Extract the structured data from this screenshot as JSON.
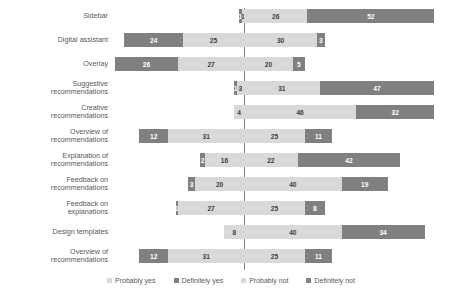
{
  "chart_data": {
    "type": "bar",
    "subtype": "diverging-stacked-bar",
    "title": "",
    "xlabel": "",
    "ylabel": "",
    "grid": false,
    "legend_position": "bottom",
    "orientation": "horizontal",
    "axis_zero_label": "0",
    "series_order_left_to_right": [
      "Definitely not",
      "Probably not",
      "Probably yes",
      "Definitely yes"
    ],
    "legend": [
      {
        "label": "Probably yes",
        "color": "#d9d9d9"
      },
      {
        "label": "Definitely yes",
        "color": "#808080"
      },
      {
        "label": "Probably not",
        "color": "#d9d9d9"
      },
      {
        "label": "Definitely not",
        "color": "#808080"
      }
    ],
    "categories": [
      "Sidebar",
      "Digital assistant",
      "Overlay",
      "Suggestive recommendations",
      "Creative recommendations",
      "Overview of recommendations",
      "Explanation of recommendations",
      "Feedback on recommendations",
      "Feedback on explanations",
      "Design templates",
      "Overview of recommendations"
    ],
    "series": [
      {
        "name": "Definitely not",
        "values": [
          1,
          24,
          26,
          1,
          0,
          12,
          2,
          3,
          1,
          0,
          12
        ]
      },
      {
        "name": "Probably not",
        "values": [
          1,
          25,
          27,
          3,
          4,
          31,
          16,
          20,
          27,
          8,
          31
        ]
      },
      {
        "name": "Probably yes",
        "values": [
          26,
          30,
          20,
          31,
          46,
          25,
          22,
          40,
          25,
          40,
          25
        ]
      },
      {
        "name": "Definitely yes",
        "values": [
          52,
          3,
          5,
          47,
          32,
          11,
          42,
          19,
          8,
          34,
          11
        ]
      }
    ]
  },
  "rows": [
    {
      "label_lines": [
        "Sidebar"
      ],
      "segments": [
        {
          "key": "dn",
          "value": "1"
        },
        {
          "key": "pn",
          "value": "1"
        },
        {
          "key": "py",
          "value": "26"
        },
        {
          "key": "dy",
          "value": "52"
        }
      ]
    },
    {
      "label_lines": [
        "Digital assistant"
      ],
      "segments": [
        {
          "key": "dn",
          "value": "24"
        },
        {
          "key": "pn",
          "value": "25"
        },
        {
          "key": "py",
          "value": "30"
        },
        {
          "key": "dy",
          "value": "3"
        }
      ]
    },
    {
      "label_lines": [
        "Overlay"
      ],
      "segments": [
        {
          "key": "dn",
          "value": "26"
        },
        {
          "key": "pn",
          "value": "27"
        },
        {
          "key": "py",
          "value": "20"
        },
        {
          "key": "dy",
          "value": "5"
        }
      ]
    },
    {
      "label_lines": [
        "Suggestive",
        "recommendations"
      ],
      "segments": [
        {
          "key": "dn",
          "value": "1"
        },
        {
          "key": "pn",
          "value": "3"
        },
        {
          "key": "py",
          "value": "31"
        },
        {
          "key": "dy",
          "value": "47"
        }
      ]
    },
    {
      "label_lines": [
        "Creative",
        "recommendations"
      ],
      "segments": [
        {
          "key": "dn",
          "value": ""
        },
        {
          "key": "pn",
          "value": "4"
        },
        {
          "key": "py",
          "value": "46"
        },
        {
          "key": "dy",
          "value": "32"
        }
      ]
    },
    {
      "label_lines": [
        "Overview of",
        "recommendations"
      ],
      "segments": [
        {
          "key": "dn",
          "value": "12"
        },
        {
          "key": "pn",
          "value": "31"
        },
        {
          "key": "py",
          "value": "25"
        },
        {
          "key": "dy",
          "value": "11"
        }
      ]
    },
    {
      "label_lines": [
        "Explanation of",
        "recommendations"
      ],
      "segments": [
        {
          "key": "dn",
          "value": "2"
        },
        {
          "key": "pn",
          "value": "16"
        },
        {
          "key": "py",
          "value": "22"
        },
        {
          "key": "dy",
          "value": "42"
        }
      ]
    },
    {
      "label_lines": [
        "Feedback on",
        "recommendations"
      ],
      "segments": [
        {
          "key": "dn",
          "value": "3"
        },
        {
          "key": "pn",
          "value": "20"
        },
        {
          "key": "py",
          "value": "40"
        },
        {
          "key": "dy",
          "value": "19"
        }
      ]
    },
    {
      "label_lines": [
        "Feedback on",
        "explanations"
      ],
      "segments": [
        {
          "key": "dn",
          "value": "1"
        },
        {
          "key": "pn",
          "value": "27"
        },
        {
          "key": "py",
          "value": "25"
        },
        {
          "key": "dy",
          "value": "8"
        }
      ]
    },
    {
      "label_lines": [
        "Design templates"
      ],
      "segments": [
        {
          "key": "dn",
          "value": ""
        },
        {
          "key": "pn",
          "value": "8"
        },
        {
          "key": "py",
          "value": "40"
        },
        {
          "key": "dy",
          "value": "34"
        }
      ]
    },
    {
      "label_lines": [
        "Overview of",
        "recommendations"
      ],
      "segments": [
        {
          "key": "dn",
          "value": "12"
        },
        {
          "key": "pn",
          "value": "31"
        },
        {
          "key": "py",
          "value": "25"
        },
        {
          "key": "dy",
          "value": "11"
        }
      ]
    }
  ],
  "colors": {
    "definitely": "#808080",
    "probably": "#d9d9d9",
    "axis": "#808080",
    "label_text": "#595959"
  }
}
